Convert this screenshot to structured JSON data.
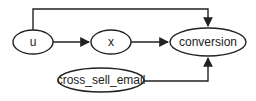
{
  "diagram": {
    "type": "causal-dag",
    "colors": {
      "stroke": "#222222",
      "background": "#ffffff",
      "text": "#222222"
    },
    "nodes": [
      {
        "id": "u",
        "label": "u",
        "cx": 33,
        "cy": 42,
        "rx": 20,
        "ry": 12
      },
      {
        "id": "x",
        "label": "x",
        "cx": 111,
        "cy": 42,
        "rx": 20,
        "ry": 12
      },
      {
        "id": "conversion",
        "label": "conversion",
        "cx": 208,
        "cy": 42,
        "rx": 38,
        "ry": 14
      },
      {
        "id": "cross_sell_email",
        "label": "cross_sell_email",
        "cx": 101,
        "cy": 80,
        "rx": 43,
        "ry": 12
      }
    ],
    "edges": [
      {
        "from": "u",
        "to": "x"
      },
      {
        "from": "x",
        "to": "conversion"
      },
      {
        "from": "u",
        "to": "conversion",
        "route": "over-top"
      },
      {
        "from": "cross_sell_email",
        "to": "conversion",
        "route": "from-below"
      }
    ]
  }
}
